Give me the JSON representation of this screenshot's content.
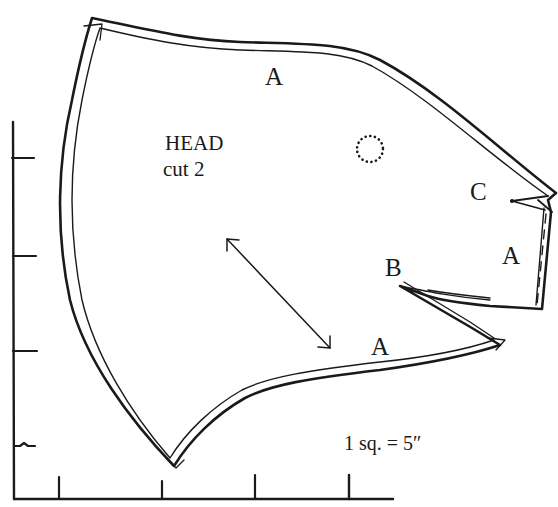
{
  "diagram": {
    "type": "sewing-pattern-piece",
    "piece": {
      "name": "HEAD",
      "cut_instruction": "cut 2"
    },
    "seam_labels": {
      "top": "A",
      "right": "A",
      "bottom": "A"
    },
    "dart_labels": {
      "upper": "C",
      "lower": "B"
    },
    "scale_note": "1 sq. = 5″",
    "grid": {
      "vertical_axis_ticks": 4,
      "horizontal_axis_ticks": 4
    },
    "markings": {
      "grainline": "double-headed-arrow",
      "eye_placement": "dotted-circle"
    },
    "colors": {
      "ink": "#1a1a1a",
      "paper": "#ffffff"
    }
  }
}
